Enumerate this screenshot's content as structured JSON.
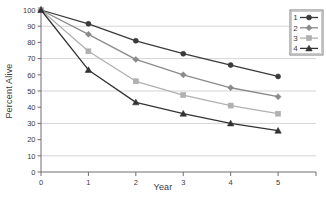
{
  "chart_data": {
    "type": "line",
    "title": "",
    "xlabel": "Year",
    "ylabel": "Percent Alive",
    "x": [
      0,
      1,
      2,
      3,
      4,
      5
    ],
    "xticklabels": [
      "0",
      "1",
      "2",
      "3",
      "4",
      "5"
    ],
    "yticklabels": [
      "0",
      "10",
      "20",
      "30",
      "40",
      "50",
      "60",
      "70",
      "80",
      "90",
      "100"
    ],
    "yticks": [
      0,
      10,
      20,
      30,
      40,
      50,
      60,
      70,
      80,
      90,
      100
    ],
    "xlim": [
      0,
      5.8
    ],
    "ylim": [
      0,
      100
    ],
    "grid": "horizontal-major-every-20",
    "gridlines": [
      10,
      30,
      50,
      70,
      90
    ],
    "legend_position": "top-right",
    "series": [
      {
        "name": "1",
        "marker": "circle",
        "color": "#3a3a3a",
        "values": [
          100,
          91.5,
          81,
          73,
          66,
          59
        ]
      },
      {
        "name": "2",
        "marker": "diamond",
        "color": "#8a8a8a",
        "values": [
          100,
          85,
          69.5,
          60,
          52,
          46.5
        ]
      },
      {
        "name": "3",
        "marker": "square",
        "color": "#b0b0b0",
        "values": [
          100,
          74.5,
          56,
          47.5,
          41,
          36
        ]
      },
      {
        "name": "4",
        "marker": "triangle",
        "color": "#333333",
        "values": [
          100,
          63,
          43,
          36,
          30,
          25.5
        ]
      }
    ]
  },
  "legend": {
    "items": [
      {
        "label": "1"
      },
      {
        "label": "2"
      },
      {
        "label": "3"
      },
      {
        "label": "4"
      }
    ]
  },
  "colors": {
    "axis": "#6e6e6e",
    "grid": "#c9c9c9",
    "text": "#3a3a3a",
    "background": "#ffffff"
  }
}
